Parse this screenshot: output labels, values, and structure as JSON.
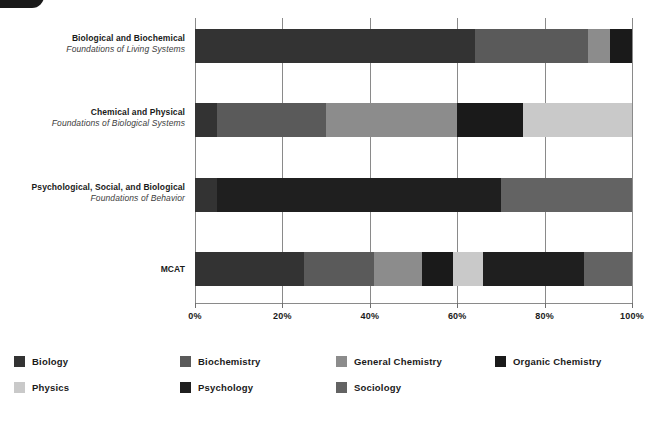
{
  "chart_data": {
    "type": "bar",
    "orientation": "horizontal",
    "stacked": true,
    "title": "",
    "xlabel": "",
    "ylabel": "",
    "xlim": [
      0,
      100
    ],
    "x_tick_labels": [
      "0%",
      "20%",
      "40%",
      "60%",
      "80%",
      "100%"
    ],
    "x_ticks": [
      0,
      20,
      40,
      60,
      80,
      100
    ],
    "grid": true,
    "legend_position": "bottom",
    "categories": [
      {
        "title": "Biological and Biochemical",
        "subtitle": "Foundations of Living Systems"
      },
      {
        "title": "Chemical and Physical",
        "subtitle": "Foundations of Biological Systems"
      },
      {
        "title": "Psychological, Social, and Biological",
        "subtitle": "Foundations of Behavior"
      },
      {
        "title": "MCAT",
        "subtitle": ""
      }
    ],
    "series": [
      {
        "name": "Biology",
        "color": "#333333",
        "values": [
          64,
          5,
          5,
          25
        ]
      },
      {
        "name": "Biochemistry",
        "color": "#5a5a5a",
        "values": [
          26,
          25,
          0,
          16
        ]
      },
      {
        "name": "General Chemistry",
        "color": "#8c8c8c",
        "values": [
          5,
          30,
          0,
          11
        ]
      },
      {
        "name": "Organic Chemistry",
        "color": "#1a1a1a",
        "values": [
          5,
          15,
          0,
          7
        ]
      },
      {
        "name": "Physics",
        "color": "#c9c9c9",
        "values": [
          0,
          25,
          0,
          7
        ]
      },
      {
        "name": "Psychology",
        "color": "#1f1f1f",
        "values": [
          0,
          0,
          65,
          23
        ]
      },
      {
        "name": "Sociology",
        "color": "#636363",
        "values": [
          0,
          0,
          30,
          11
        ]
      }
    ],
    "stacks": [
      [
        {
          "name": "Biology",
          "start": 0,
          "end": 64,
          "value": 64,
          "color": "#333333"
        },
        {
          "name": "Biochemistry",
          "start": 64,
          "end": 90,
          "value": 26,
          "color": "#5a5a5a"
        },
        {
          "name": "General Chemistry",
          "start": 90,
          "end": 95,
          "value": 5,
          "color": "#8c8c8c"
        },
        {
          "name": "Organic Chemistry",
          "start": 95,
          "end": 100,
          "value": 5,
          "color": "#1a1a1a"
        }
      ],
      [
        {
          "name": "Biology",
          "start": 0,
          "end": 5,
          "value": 5,
          "color": "#333333"
        },
        {
          "name": "Biochemistry",
          "start": 5,
          "end": 30,
          "value": 25,
          "color": "#5a5a5a"
        },
        {
          "name": "General Chemistry",
          "start": 30,
          "end": 60,
          "value": 30,
          "color": "#8c8c8c"
        },
        {
          "name": "Organic Chemistry",
          "start": 60,
          "end": 75,
          "value": 15,
          "color": "#1a1a1a"
        },
        {
          "name": "Physics",
          "start": 75,
          "end": 100,
          "value": 25,
          "color": "#c9c9c9"
        }
      ],
      [
        {
          "name": "Biology",
          "start": 0,
          "end": 5,
          "value": 5,
          "color": "#333333"
        },
        {
          "name": "Psychology",
          "start": 5,
          "end": 70,
          "value": 65,
          "color": "#1f1f1f"
        },
        {
          "name": "Sociology",
          "start": 70,
          "end": 100,
          "value": 30,
          "color": "#636363"
        }
      ],
      [
        {
          "name": "Biology",
          "start": 0,
          "end": 25,
          "value": 25,
          "color": "#333333"
        },
        {
          "name": "Biochemistry",
          "start": 25,
          "end": 41,
          "value": 16,
          "color": "#5a5a5a"
        },
        {
          "name": "General Chemistry",
          "start": 41,
          "end": 52,
          "value": 11,
          "color": "#8c8c8c"
        },
        {
          "name": "Organic Chemistry",
          "start": 52,
          "end": 59,
          "value": 7,
          "color": "#1a1a1a"
        },
        {
          "name": "Physics",
          "start": 59,
          "end": 66,
          "value": 7,
          "color": "#c9c9c9"
        },
        {
          "name": "Psychology",
          "start": 66,
          "end": 89,
          "value": 23,
          "color": "#1f1f1f"
        },
        {
          "name": "Sociology",
          "start": 89,
          "end": 100,
          "value": 11,
          "color": "#636363"
        }
      ]
    ],
    "legend": [
      {
        "label": "Biology",
        "color": "#333333"
      },
      {
        "label": "Biochemistry",
        "color": "#5a5a5a"
      },
      {
        "label": "General Chemistry",
        "color": "#8c8c8c"
      },
      {
        "label": "Organic Chemistry",
        "color": "#1a1a1a"
      },
      {
        "label": "Physics",
        "color": "#c9c9c9"
      },
      {
        "label": "Psychology",
        "color": "#1f1f1f"
      },
      {
        "label": "Sociology",
        "color": "#636363"
      }
    ]
  }
}
